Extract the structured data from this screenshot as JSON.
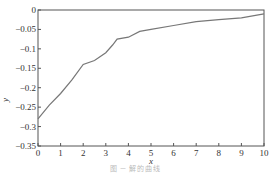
{
  "chart_data": {
    "type": "line",
    "title": "",
    "xlabel": "x",
    "ylabel": "y",
    "xlim": [
      0,
      10
    ],
    "ylim": [
      -0.35,
      0
    ],
    "grid": false,
    "legend": null,
    "x_ticks": [
      "0",
      "1",
      "2",
      "3",
      "4",
      "5",
      "6",
      "7",
      "8",
      "9",
      "10"
    ],
    "y_ticks": [
      "0",
      "-0.05",
      "-0.1",
      "-0.15",
      "-0.2",
      "-0.25",
      "-0.3",
      "-0.35"
    ],
    "series": [
      {
        "name": "y(x)",
        "color": "#777777",
        "x": [
          0,
          0.5,
          1.0,
          1.5,
          2.0,
          2.5,
          3.0,
          3.3,
          3.5,
          4.0,
          4.5,
          5.0,
          6.0,
          7.0,
          8.0,
          9.0,
          10.0
        ],
        "y": [
          -0.28,
          -0.245,
          -0.215,
          -0.18,
          -0.14,
          -0.13,
          -0.11,
          -0.09,
          -0.075,
          -0.07,
          -0.055,
          -0.05,
          -0.04,
          -0.03,
          -0.025,
          -0.02,
          -0.01
        ]
      }
    ]
  },
  "caption": "图 ─ 解的曲线"
}
